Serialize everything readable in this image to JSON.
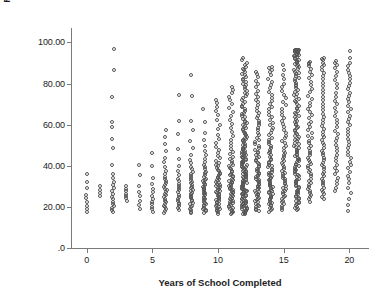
{
  "chart_data": {
    "type": "scatter",
    "title": "",
    "xlabel": "Years of School Completed",
    "ylabel": "R's Socioeconomic Index",
    "xlim": [
      -1.2,
      21.5
    ],
    "ylim": [
      0,
      107
    ],
    "grid": false,
    "legend": null,
    "marker": {
      "shape": "open-circle",
      "size_px": 4,
      "edge_color": "#555555",
      "fill_color": "none"
    },
    "axis_color": "#7a7a7a",
    "xticks": [
      0,
      5,
      10,
      15,
      20
    ],
    "xtick_labels": [
      "0",
      "5",
      "10",
      "15",
      "20"
    ],
    "yticks": [
      0,
      20,
      40,
      60,
      80,
      100
    ],
    "ytick_labels": [
      ".0",
      "20.00",
      "40.00",
      "60.00",
      "80.00",
      "100.00"
    ],
    "note": "Each x column is an integer number of years of schooling; y values are Socioeconomic Index scores. columns[] gives per-x observed y-value distribution.",
    "columns": [
      {
        "x": 0,
        "n": 9,
        "y_min": 17.4,
        "y_max": 36.0,
        "y_values": [
          17.5,
          19.0,
          20.6,
          22.4,
          24.2,
          25.9,
          29.4,
          32.1,
          35.8
        ]
      },
      {
        "x": 1,
        "n": 4,
        "y_min": 25.2,
        "y_max": 30.4,
        "y_values": [
          25.3,
          26.8,
          28.4,
          30.2
        ]
      },
      {
        "x": 2,
        "n": 22,
        "y_min": 17.2,
        "y_max": 96.8,
        "y_values": [
          17.3,
          18.6,
          19.4,
          20.3,
          21.5,
          22.6,
          23.8,
          25.0,
          26.2,
          27.6,
          29.0,
          30.5,
          32.2,
          34.0,
          36.2,
          40.2,
          48.4,
          53.0,
          58.8,
          61.2,
          73.4,
          86.4,
          96.8
        ]
      },
      {
        "x": 3,
        "n": 7,
        "y_min": 22.8,
        "y_max": 30.4,
        "y_values": [
          22.9,
          24.2,
          25.4,
          26.4,
          27.6,
          28.8,
          30.2
        ]
      },
      {
        "x": 4,
        "n": 8,
        "y_min": 19.0,
        "y_max": 40.6,
        "y_values": [
          19.1,
          21.0,
          23.0,
          25.2,
          27.4,
          30.0,
          35.4,
          40.4
        ]
      },
      {
        "x": 5,
        "n": 13,
        "y_min": 17.4,
        "y_max": 46.2,
        "y_values": [
          17.5,
          18.8,
          20.0,
          21.3,
          22.6,
          24.0,
          25.5,
          27.0,
          28.8,
          31.0,
          34.2,
          40.0,
          46.0
        ]
      },
      {
        "x": 6,
        "n": 30,
        "y_min": 17.0,
        "y_max": 57.8,
        "y_values": [
          17.1,
          18.0,
          18.9,
          19.8,
          20.6,
          21.4,
          22.2,
          23.0,
          23.9,
          24.8,
          25.6,
          26.4,
          27.2,
          28.0,
          28.9,
          29.8,
          30.6,
          31.4,
          32.4,
          33.4,
          34.6,
          36.0,
          37.6,
          39.4,
          41.6,
          44.0,
          47.0,
          50.6,
          54.0,
          57.6
        ]
      },
      {
        "x": 7,
        "n": 24,
        "y_min": 18.4,
        "y_max": 74.8,
        "y_values": [
          18.5,
          19.4,
          20.3,
          21.2,
          22.1,
          23.0,
          24.0,
          25.0,
          26.0,
          27.0,
          28.0,
          29.0,
          30.0,
          31.2,
          32.4,
          33.8,
          35.4,
          37.4,
          40.0,
          43.4,
          48.0,
          55.6,
          61.6,
          74.6
        ]
      },
      {
        "x": 8,
        "n": 38,
        "y_min": 16.8,
        "y_max": 84.2,
        "y_values": [
          16.9,
          17.7,
          18.5,
          19.2,
          19.9,
          20.6,
          21.3,
          22.0,
          22.7,
          23.4,
          24.1,
          24.8,
          25.5,
          26.2,
          26.9,
          27.6,
          28.3,
          29.0,
          29.8,
          30.6,
          31.4,
          32.2,
          33.0,
          33.9,
          34.8,
          35.8,
          36.9,
          38.2,
          39.6,
          41.2,
          43.0,
          45.4,
          48.4,
          52.0,
          57.4,
          62.0,
          74.0,
          84.0
        ]
      },
      {
        "x": 9,
        "n": 44,
        "y_min": 17.0,
        "y_max": 67.8,
        "y_values": [
          17.1,
          17.8,
          18.4,
          19.0,
          19.6,
          20.2,
          20.8,
          21.4,
          22.0,
          22.6,
          23.2,
          23.8,
          24.4,
          25.0,
          25.6,
          26.2,
          26.8,
          27.4,
          28.0,
          28.6,
          29.2,
          29.8,
          30.4,
          31.0,
          31.7,
          32.4,
          33.1,
          33.8,
          34.6,
          35.4,
          36.3,
          37.2,
          38.2,
          39.3,
          40.5,
          41.8,
          43.3,
          45.0,
          47.0,
          49.4,
          52.4,
          56.0,
          61.4,
          67.6
        ]
      },
      {
        "x": 10,
        "n": 62,
        "y_min": 16.6,
        "y_max": 72.4,
        "y_values": [
          16.7,
          17.3,
          17.8,
          18.3,
          18.8,
          19.3,
          19.8,
          20.3,
          20.8,
          21.3,
          21.8,
          22.3,
          22.8,
          23.3,
          23.8,
          24.3,
          24.8,
          25.3,
          25.8,
          26.3,
          26.8,
          27.3,
          27.8,
          28.3,
          28.8,
          29.3,
          29.8,
          30.3,
          30.8,
          31.3,
          31.8,
          32.3,
          32.9,
          33.5,
          34.1,
          34.7,
          35.3,
          36.0,
          36.7,
          37.4,
          38.1,
          38.9,
          39.7,
          40.6,
          41.5,
          42.5,
          43.6,
          44.8,
          46.1,
          47.5,
          49.1,
          50.9,
          52.9,
          55.2,
          57.8,
          60.0,
          62.4,
          64.6,
          66.4,
          68.4,
          70.4,
          72.2
        ]
      },
      {
        "x": 11,
        "n": 70,
        "y_min": 16.4,
        "y_max": 78.6,
        "y_values": [
          16.5,
          17.0,
          17.5,
          18.0,
          18.5,
          19.0,
          19.4,
          19.9,
          20.4,
          20.8,
          21.3,
          21.8,
          22.2,
          22.7,
          23.2,
          23.6,
          24.1,
          24.6,
          25.1,
          25.6,
          26.1,
          26.6,
          27.1,
          27.6,
          28.1,
          28.6,
          29.1,
          29.6,
          30.1,
          30.6,
          31.1,
          31.6,
          32.2,
          32.7,
          33.3,
          33.8,
          34.4,
          35.0,
          35.6,
          36.2,
          36.9,
          37.6,
          38.3,
          39.0,
          39.8,
          40.6,
          41.5,
          42.4,
          43.4,
          44.4,
          45.6,
          46.8,
          48.1,
          49.5,
          51.0,
          52.7,
          54.5,
          56.5,
          58.6,
          60.4,
          62.2,
          64.0,
          66.0,
          68.0,
          70.0,
          71.8,
          73.6,
          75.4,
          77.0,
          78.4
        ]
      },
      {
        "x": 12,
        "n": 145,
        "y_min": 16.2,
        "y_max": 92.6,
        "y_values": [
          16.3,
          16.7,
          17.0,
          17.4,
          17.7,
          18.1,
          18.4,
          18.8,
          19.1,
          19.5,
          19.8,
          20.2,
          20.5,
          20.9,
          21.2,
          21.6,
          21.9,
          22.3,
          22.6,
          23.0,
          23.3,
          23.7,
          24.0,
          24.4,
          24.7,
          25.1,
          25.4,
          25.8,
          26.1,
          26.5,
          26.8,
          27.2,
          27.5,
          27.9,
          28.2,
          28.6,
          28.9,
          29.3,
          29.6,
          30.0,
          30.4,
          30.7,
          31.1,
          31.4,
          31.8,
          32.1,
          32.5,
          32.8,
          33.2,
          33.6,
          33.9,
          34.3,
          34.7,
          35.0,
          35.4,
          35.8,
          36.1,
          36.5,
          36.9,
          37.3,
          37.6,
          38.0,
          38.4,
          38.8,
          39.2,
          39.6,
          40.0,
          40.4,
          40.8,
          41.2,
          41.6,
          42.0,
          42.4,
          42.8,
          43.2,
          43.7,
          44.1,
          44.5,
          45.0,
          45.4,
          45.9,
          46.4,
          46.8,
          47.3,
          47.8,
          48.3,
          48.8,
          49.3,
          49.8,
          50.3,
          50.8,
          51.4,
          51.9,
          52.5,
          53.0,
          53.6,
          54.2,
          54.8,
          55.4,
          56.0,
          56.6,
          57.2,
          57.9,
          58.5,
          59.2,
          59.9,
          60.6,
          61.3,
          62.0,
          62.8,
          63.5,
          64.3,
          65.1,
          65.9,
          66.7,
          67.5,
          68.4,
          69.3,
          70.2,
          71.1,
          72.0,
          72.9,
          73.8,
          74.7,
          75.6,
          76.5,
          77.4,
          78.3,
          79.2,
          80.0,
          80.8,
          81.6,
          82.4,
          83.2,
          84.0,
          84.8,
          85.6,
          86.4,
          87.2,
          88.0,
          89.0,
          90.2,
          91.4,
          92.4
        ]
      },
      {
        "x": 13,
        "n": 78,
        "y_min": 17.8,
        "y_max": 86.0,
        "y_values": [
          17.9,
          18.6,
          19.2,
          19.8,
          20.4,
          21.0,
          21.6,
          22.2,
          22.8,
          23.4,
          24.0,
          24.5,
          25.1,
          25.7,
          26.2,
          26.8,
          27.4,
          27.9,
          28.5,
          29.1,
          29.6,
          30.2,
          30.8,
          31.3,
          31.9,
          32.5,
          33.1,
          33.7,
          34.3,
          34.9,
          35.5,
          36.1,
          36.7,
          37.3,
          38.0,
          38.6,
          39.3,
          40.0,
          40.7,
          41.4,
          42.1,
          42.8,
          43.6,
          44.4,
          45.2,
          46.0,
          46.9,
          47.8,
          48.7,
          49.6,
          50.6,
          51.6,
          52.6,
          53.7,
          54.8,
          56.0,
          57.2,
          58.4,
          59.6,
          60.8,
          62.0,
          63.2,
          64.4,
          65.6,
          66.8,
          68.0,
          69.4,
          70.8,
          72.2,
          73.6,
          75.0,
          76.6,
          78.2,
          79.8,
          81.4,
          83.0,
          84.6,
          85.8
        ]
      },
      {
        "x": 14,
        "n": 80,
        "y_min": 17.6,
        "y_max": 88.4,
        "y_values": [
          17.7,
          18.4,
          19.0,
          19.6,
          20.2,
          20.8,
          21.4,
          22.0,
          22.6,
          23.2,
          23.8,
          24.4,
          25.0,
          25.5,
          26.1,
          26.7,
          27.2,
          27.8,
          28.4,
          29.0,
          29.5,
          30.1,
          30.7,
          31.3,
          31.8,
          32.4,
          33.0,
          33.6,
          34.2,
          34.8,
          35.4,
          36.0,
          36.6,
          37.2,
          37.9,
          38.5,
          39.2,
          39.9,
          40.6,
          41.3,
          42.0,
          42.8,
          43.5,
          44.3,
          45.1,
          46.0,
          46.8,
          47.7,
          48.6,
          49.6,
          50.6,
          51.6,
          52.6,
          53.7,
          54.8,
          56.0,
          57.2,
          58.4,
          59.6,
          60.9,
          62.2,
          63.5,
          64.8,
          66.1,
          67.4,
          68.8,
          70.2,
          71.6,
          73.0,
          74.5,
          76.0,
          77.6,
          79.2,
          80.8,
          82.4,
          84.0,
          85.4,
          86.6,
          87.6,
          88.2
        ]
      },
      {
        "x": 15,
        "n": 60,
        "y_min": 18.6,
        "y_max": 89.6,
        "y_values": [
          18.7,
          19.6,
          20.5,
          21.4,
          22.2,
          23.0,
          23.8,
          24.6,
          25.4,
          26.2,
          27.0,
          27.8,
          28.6,
          29.4,
          30.2,
          31.0,
          31.8,
          32.6,
          33.4,
          34.2,
          35.0,
          35.8,
          36.7,
          37.6,
          38.5,
          39.4,
          40.3,
          41.2,
          42.2,
          43.2,
          44.2,
          45.2,
          46.3,
          47.4,
          48.5,
          49.7,
          50.9,
          52.1,
          53.4,
          54.7,
          56.0,
          57.4,
          58.8,
          60.2,
          61.6,
          63.1,
          64.6,
          66.2,
          67.8,
          69.4,
          71.0,
          72.8,
          74.6,
          76.4,
          78.2,
          80.0,
          82.0,
          84.2,
          86.6,
          89.2
        ]
      },
      {
        "x": 16,
        "n": 132,
        "y_min": 18.2,
        "y_max": 96.4,
        "y_values": [
          18.3,
          18.9,
          19.5,
          20.1,
          20.7,
          21.3,
          21.9,
          22.5,
          23.1,
          23.7,
          24.3,
          24.9,
          25.5,
          26.1,
          26.6,
          27.2,
          27.8,
          28.4,
          29.0,
          29.6,
          30.2,
          30.8,
          31.4,
          32.0,
          32.6,
          33.2,
          33.8,
          34.4,
          35.0,
          35.6,
          36.2,
          36.8,
          37.4,
          38.0,
          38.6,
          39.2,
          39.8,
          40.4,
          41.0,
          41.6,
          42.2,
          42.8,
          43.4,
          44.0,
          44.6,
          45.3,
          45.9,
          46.5,
          47.2,
          47.8,
          48.5,
          49.1,
          49.8,
          50.5,
          51.1,
          51.8,
          52.5,
          53.2,
          53.9,
          54.6,
          55.3,
          56.0,
          56.7,
          57.4,
          58.2,
          58.9,
          59.7,
          60.4,
          61.2,
          62.0,
          62.7,
          63.5,
          64.3,
          65.1,
          65.9,
          66.7,
          67.5,
          68.3,
          69.2,
          70.0,
          70.8,
          71.7,
          72.5,
          73.4,
          74.2,
          75.1,
          76.0,
          76.9,
          77.8,
          78.6,
          79.5,
          80.4,
          81.2,
          82.0,
          82.8,
          83.6,
          84.4,
          85.1,
          85.8,
          86.5,
          87.2,
          87.8,
          88.4,
          89.0,
          89.6,
          90.1,
          90.6,
          91.1,
          91.6,
          92.0,
          92.4,
          92.8,
          93.2,
          93.5,
          93.8,
          94.1,
          94.4,
          94.6,
          94.8,
          95.0,
          95.2,
          95.4,
          95.6,
          95.7,
          95.8,
          95.9,
          96.0,
          96.1,
          96.2,
          96.3,
          96.35,
          96.4
        ]
      },
      {
        "x": 17,
        "n": 56,
        "y_min": 22.4,
        "y_max": 90.8,
        "y_values": [
          22.5,
          23.6,
          24.7,
          25.8,
          26.8,
          27.8,
          28.8,
          29.8,
          30.8,
          31.8,
          32.8,
          33.8,
          34.8,
          35.8,
          36.8,
          37.8,
          38.8,
          39.8,
          40.8,
          41.8,
          42.9,
          44.0,
          45.1,
          46.2,
          47.3,
          48.5,
          49.7,
          50.9,
          52.1,
          53.4,
          54.7,
          56.0,
          57.3,
          58.7,
          60.1,
          61.5,
          63.0,
          64.5,
          66.0,
          67.5,
          69.1,
          70.7,
          72.3,
          74.0,
          75.7,
          77.4,
          79.1,
          80.8,
          82.5,
          84.2,
          85.8,
          87.2,
          88.4,
          89.4,
          90.2,
          90.6
        ]
      },
      {
        "x": 18,
        "n": 54,
        "y_min": 23.8,
        "y_max": 92.4,
        "y_values": [
          23.9,
          25.0,
          26.1,
          27.2,
          28.3,
          29.4,
          30.5,
          31.6,
          32.7,
          33.8,
          34.9,
          36.0,
          37.1,
          38.2,
          39.3,
          40.4,
          41.5,
          42.6,
          43.8,
          45.0,
          46.2,
          47.4,
          48.6,
          49.9,
          51.2,
          52.5,
          53.8,
          55.2,
          56.6,
          58.0,
          59.4,
          60.9,
          62.4,
          63.9,
          65.4,
          67.0,
          68.6,
          70.2,
          71.8,
          73.5,
          75.2,
          76.9,
          78.6,
          80.3,
          82.0,
          83.6,
          85.2,
          86.7,
          88.0,
          89.2,
          90.2,
          91.2,
          91.9,
          92.3
        ]
      },
      {
        "x": 19,
        "n": 38,
        "y_min": 27.6,
        "y_max": 91.0,
        "y_values": [
          27.7,
          29.4,
          31.0,
          32.6,
          34.2,
          35.8,
          37.4,
          39.0,
          40.6,
          42.2,
          43.8,
          45.4,
          47.0,
          48.6,
          50.2,
          51.9,
          53.6,
          55.3,
          57.0,
          58.8,
          60.6,
          62.4,
          64.2,
          66.0,
          67.9,
          69.8,
          71.7,
          73.6,
          75.6,
          77.6,
          79.6,
          81.6,
          83.6,
          85.6,
          87.4,
          89.0,
          90.2,
          90.8
        ]
      },
      {
        "x": 20,
        "n": 44,
        "y_min": 17.8,
        "y_max": 96.2,
        "y_values": [
          17.9,
          21.0,
          24.0,
          26.8,
          29.2,
          31.4,
          33.4,
          35.2,
          37.0,
          38.8,
          40.4,
          42.0,
          43.6,
          45.2,
          46.8,
          48.4,
          50.0,
          51.6,
          53.2,
          54.8,
          56.4,
          58.0,
          59.6,
          61.2,
          62.8,
          64.4,
          66.0,
          67.6,
          69.2,
          70.8,
          72.4,
          74.0,
          75.6,
          77.2,
          78.8,
          80.4,
          82.0,
          83.6,
          85.2,
          86.8,
          88.4,
          90.0,
          92.4,
          96.0
        ]
      }
    ]
  }
}
